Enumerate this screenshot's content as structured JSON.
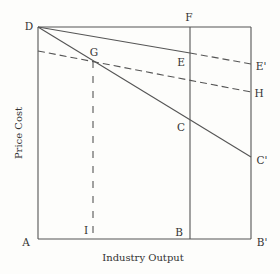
{
  "diagram": {
    "axes": {
      "x_label": "Industry Output",
      "y_label": "Price Cost"
    },
    "points": {
      "A": "A",
      "B": "B",
      "B_prime": "B'",
      "C": "C",
      "C_prime": "C'",
      "D": "D",
      "E": "E",
      "E_prime": "E'",
      "F": "F",
      "G": "G",
      "H": "H",
      "I": "I"
    },
    "segments": [
      {
        "from": "D",
        "to": "F",
        "style": "solid"
      },
      {
        "from": "D",
        "to": "A",
        "style": "solid"
      },
      {
        "from": "A",
        "to": "B'",
        "style": "solid"
      },
      {
        "from": "F",
        "to": "B",
        "style": "solid"
      },
      {
        "from": "B'",
        "to": "top-right corner",
        "style": "solid"
      },
      {
        "from": "D",
        "to": "E",
        "style": "solid"
      },
      {
        "from": "E",
        "to": "E'",
        "style": "dashed"
      },
      {
        "from": "D",
        "to": "C'",
        "style": "solid"
      },
      {
        "from": "price axis",
        "to": "H",
        "style": "dashed",
        "through": "G"
      },
      {
        "from": "G",
        "to": "I",
        "style": "dashed"
      }
    ]
  },
  "colors": {
    "line": "#555555",
    "text": "#333333",
    "background": "#fdfdfb"
  }
}
